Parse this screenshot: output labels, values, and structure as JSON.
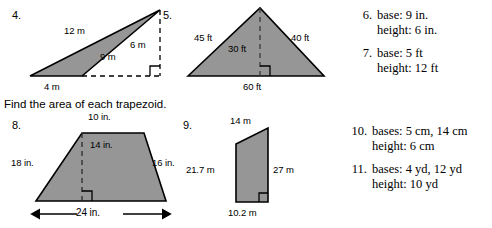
{
  "instruction": "Find the area of each trapezoid.",
  "problems": {
    "p4": {
      "number": "4.",
      "shape": "obtuse-triangle",
      "labels": {
        "side_upper": "12 m",
        "height": "6 m",
        "side_lower": "9 m",
        "base": "4 m"
      }
    },
    "p5": {
      "number": "5.",
      "shape": "triangle",
      "labels": {
        "left_side": "45 ft",
        "right_side": "40 ft",
        "height": "30 ft",
        "base": "60 ft"
      }
    },
    "p6": {
      "number": "6.",
      "line1": "base: 9 in.",
      "line2": "height: 6 in."
    },
    "p7": {
      "number": "7.",
      "line1": "base: 5 ft",
      "line2": "height: 12 ft"
    },
    "p8": {
      "number": "8.",
      "shape": "trapezoid",
      "labels": {
        "top_base": "10 in.",
        "height": "14 in.",
        "left_side": "18 in.",
        "right_side": "16 in.",
        "bottom_base": "24 in."
      }
    },
    "p9": {
      "number": "9.",
      "shape": "right-trapezoid",
      "labels": {
        "top_base": "14 m",
        "left_side": "21.7 m",
        "right_side": "27 m",
        "bottom_base": "10.2 m"
      }
    },
    "p10": {
      "number": "10.",
      "line1": "bases: 5 cm, 14 cm",
      "line2": "height: 6 cm"
    },
    "p11": {
      "number": "11.",
      "line1": "bases: 4 yd, 12 yd",
      "line2": "height: 10 yd"
    }
  },
  "style": {
    "fill_gray": "#969696",
    "stroke": "#000000",
    "page_bg": "#ffffff"
  }
}
